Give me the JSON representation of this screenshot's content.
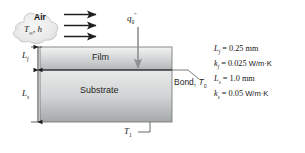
{
  "diagram": {
    "cloud": {
      "medium": "Air",
      "conditions_temp": "T",
      "conditions_temp_sub": "∞",
      "conditions_h": "h"
    },
    "flux": {
      "symbol": "q",
      "sub": "0",
      "sup": "″"
    },
    "layers": {
      "film": "Film",
      "substrate": "Substrate"
    },
    "dimensions": {
      "film_thickness_symbol": "L",
      "film_thickness_sub": "f",
      "substrate_thickness_symbol": "L",
      "substrate_thickness_sub": "s"
    },
    "bond": {
      "label": "Bond,",
      "temp_symbol": "T",
      "temp_sub": "0"
    },
    "bottom": {
      "temp_symbol": "T",
      "temp_sub": "1"
    },
    "properties": [
      {
        "symbol": "L",
        "sub": "f",
        "value": "0.25 mm",
        "unit": ""
      },
      {
        "symbol": "k",
        "sub": "f",
        "value": "0.025",
        "unit": "W/m·K"
      },
      {
        "symbol": "L",
        "sub": "s",
        "value": "1.0 mm",
        "unit": ""
      },
      {
        "symbol": "k",
        "sub": "s",
        "value": "0.05",
        "unit": "W/m·K"
      }
    ],
    "colors": {
      "film_light": "#eceded",
      "film_dark": "#b9bcbd",
      "substrate_light": "#e3e5e5",
      "substrate_dark": "#a9acad",
      "outline": "#4a4a4a",
      "arrow": "#1f1f1f",
      "text": "#1a1a1a",
      "cloud_fill": "#ececec"
    }
  }
}
